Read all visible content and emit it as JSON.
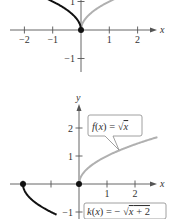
{
  "chart_data": [
    {
      "type": "line",
      "title": "",
      "xlabel": "x",
      "ylabel": "",
      "xlim": [
        -2.8,
        2.9
      ],
      "ylim": [
        -1.7,
        1.0
      ],
      "x_ticks": [
        -2,
        -1,
        1,
        2
      ],
      "x_tick_labels": [
        "−2",
        "−1",
        "1",
        "2"
      ],
      "y_ticks": [
        1,
        -1
      ],
      "y_tick_labels": [
        "1",
        "−1"
      ],
      "grid": false,
      "series": [
        {
          "name": "f(x) = √x",
          "function": "sqrt(x)",
          "domain": [
            0,
            2.8
          ],
          "color": "#b0b0b0"
        },
        {
          "name": "-√(-x)",
          "function": "sqrt(-x)",
          "domain": [
            -1.4,
            0
          ],
          "color": "#111111"
        }
      ],
      "points": [
        {
          "x": 0,
          "y": 0,
          "color": "#111111"
        }
      ]
    },
    {
      "type": "line",
      "title": "",
      "xlabel": "x",
      "ylabel": "y",
      "xlim": [
        -2.8,
        2.9
      ],
      "ylim": [
        -1.2,
        2.9
      ],
      "x_ticks": [
        -2,
        -1,
        1,
        2
      ],
      "x_tick_labels": [
        "",
        "",
        "1",
        "2"
      ],
      "y_ticks": [
        2,
        1,
        -1
      ],
      "y_tick_labels": [
        "2",
        "1",
        "−1"
      ],
      "grid": false,
      "series": [
        {
          "name": "f(x) = √x",
          "function": "sqrt(x)",
          "domain": [
            0,
            2.8
          ],
          "color": "#b0b0b0"
        },
        {
          "name": "k(x) = −√(x + 2)",
          "function": "-sqrt(x+2)",
          "domain": [
            -2,
            -0.8
          ],
          "color": "#111111"
        }
      ],
      "points": [
        {
          "x": -2,
          "y": 0,
          "color": "#111111"
        },
        {
          "x": 0,
          "y": 0,
          "color": "#111111"
        }
      ],
      "annotations": [
        {
          "text_parts": [
            "f(x) = ",
            "√",
            "x"
          ],
          "label": "f(x) = √x",
          "points_to": {
            "x": 1.3,
            "y": 1.14
          }
        },
        {
          "text_parts": [
            "k(x) = − ",
            "√",
            "x + 2"
          ],
          "label": "k(x) = −√(x + 2)"
        }
      ]
    }
  ],
  "colors": {
    "axis": "#555555",
    "light_curve": "#b0b0b0",
    "dark_curve": "#111111"
  }
}
